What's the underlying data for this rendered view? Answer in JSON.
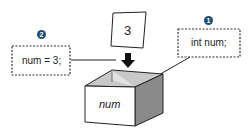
{
  "diagram": {
    "step1": {
      "badge": "1",
      "code": "int num;"
    },
    "step2": {
      "badge": "2",
      "code": "num = 3;"
    },
    "card_value": "3",
    "box_label": "num"
  },
  "colors": {
    "badge": "#1d4f73",
    "box_front": "#ffffff",
    "box_side": "#8a8a8a",
    "box_inner": "#c8c8c8",
    "stroke": "#222222"
  }
}
